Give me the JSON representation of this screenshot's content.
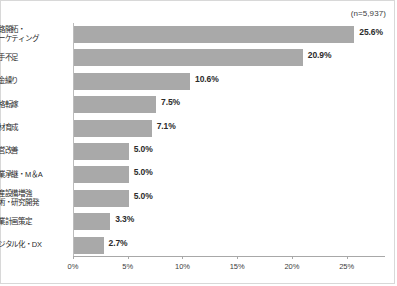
{
  "chart_data": {
    "type": "bar",
    "orientation": "horizontal",
    "title": "",
    "subtitle": "",
    "annotation": "(n=5,937)",
    "xlabel": "",
    "ylabel": "",
    "grid": false,
    "legend": false,
    "xlim": [
      0,
      28.5
    ],
    "xticks": [
      0,
      5,
      10,
      15,
      20,
      25
    ],
    "xtick_labels": [
      "0%",
      "5%",
      "10%",
      "15%",
      "20%",
      "25%"
    ],
    "categories": [
      "販路開拓・マーケティング",
      "人手不足",
      "資金繰り",
      "価格転嫁",
      "人材育成",
      "経営改善",
      "事業承継・M＆A",
      "生産設備増強・技術・研究開発",
      "事業計画策定",
      "デジタル化・DX"
    ],
    "category_lines": [
      [
        "販路開拓・",
        "マーケティング"
      ],
      [
        "人手不足"
      ],
      [
        "資金繰り"
      ],
      [
        "価格転嫁"
      ],
      [
        "人材育成"
      ],
      [
        "経営改善"
      ],
      [
        "事業承継・M＆A"
      ],
      [
        "生産設備増強",
        "技術・研究開発"
      ],
      [
        "事業計画策定"
      ],
      [
        "デジタル化・DX"
      ]
    ],
    "values": [
      25.6,
      20.9,
      10.6,
      7.5,
      7.1,
      5.0,
      5.0,
      5.0,
      3.3,
      2.7
    ],
    "value_labels": [
      "25.6%",
      "20.9%",
      "10.6%",
      "7.5%",
      "7.1%",
      "5.0%",
      "5.0%",
      "5.0%",
      "3.3%",
      "2.7%"
    ],
    "bar_color": "#a9a9a9",
    "axis_color": "#a8a8a8",
    "text_color": "#2b2b2b",
    "background": "#ffffff"
  }
}
